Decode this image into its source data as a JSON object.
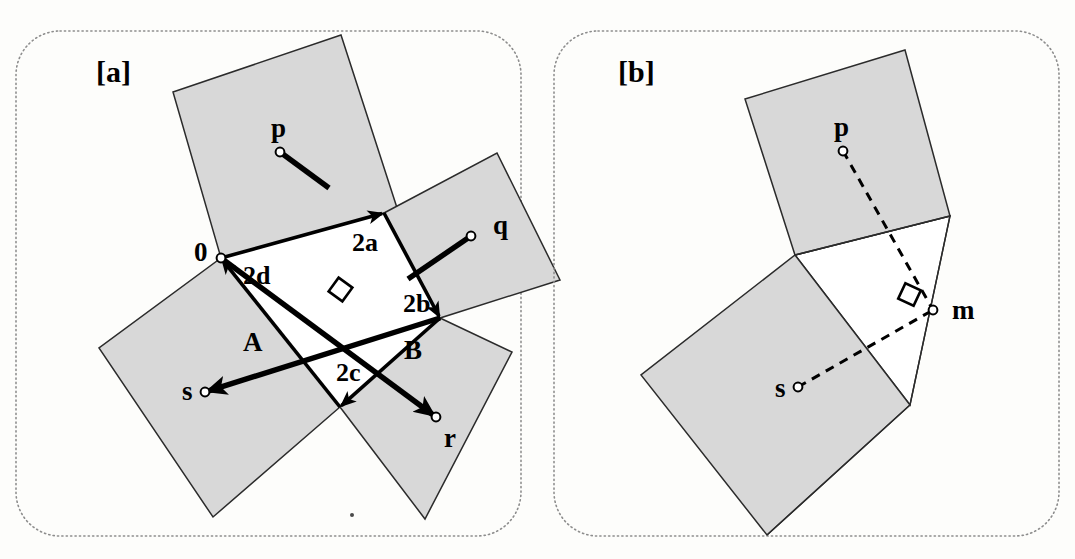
{
  "figure": {
    "background_color": "#fdfdfb",
    "square_fill_color": "#d8d8d8",
    "stroke_color": "#2b2b2b",
    "panel_border_color": "#8d8d8d"
  },
  "panels": [
    {
      "tag": "[a]",
      "tag_x": 96,
      "tag_y": 82,
      "border": {
        "x": 16,
        "y": 31,
        "w": 505,
        "h": 505,
        "r": 44
      },
      "squares": [
        {
          "name": "square-p",
          "points": "173,92 341,35 399,214 221,258",
          "center_label": "p"
        },
        {
          "name": "square-q",
          "points": "384,213 497,153 560,280 440,318",
          "center_label": "q"
        },
        {
          "name": "square-r",
          "points": "440,318 512,352 425,519 340,407",
          "center_label": "r"
        },
        {
          "name": "square-s",
          "points": "221,258 340,407 213,517 99,348",
          "center_label": "s"
        }
      ],
      "inner_quad": {
        "name": "inner-quadrilateral",
        "points": "221,258 384,213 440,318 340,407"
      },
      "vectors": [
        {
          "name": "vector-A",
          "label": "A",
          "label_x": 243,
          "label_y": 351,
          "from_x": 440,
          "from_y": 318,
          "to_x": 205,
          "to_y": 392,
          "endpoint": "s",
          "width": "thick"
        },
        {
          "name": "vector-B",
          "label": "B",
          "label_x": 404,
          "label_y": 359,
          "from_x": 221,
          "from_y": 258,
          "to_x": 436,
          "to_y": 417,
          "endpoint": "r",
          "width": "thick"
        }
      ],
      "measures": [
        {
          "name": "measure-2a",
          "label": "2a",
          "label_x": 352,
          "label_y": 251,
          "tip_x": 384,
          "tip_y": 213,
          "tail_x": 221,
          "tail_y": 258
        },
        {
          "name": "measure-2b",
          "label": "2b",
          "label_x": 403,
          "label_y": 312,
          "tip_x": 440,
          "tip_y": 318,
          "tail_x": 384,
          "tail_y": 213
        },
        {
          "name": "measure-2c",
          "label": "2c",
          "label_x": 336,
          "label_y": 381,
          "tip_x": 340,
          "tip_y": 407,
          "tail_x": 440,
          "tail_y": 318
        },
        {
          "name": "measure-2d",
          "label": "2d",
          "label_x": 243,
          "label_y": 284,
          "tip_x": 221,
          "tip_y": 258,
          "tail_x": 340,
          "tail_y": 407
        }
      ],
      "nodes": [
        {
          "name": "node-p",
          "label": "p",
          "cx": 280,
          "cy": 152,
          "label_x": 271,
          "label_y": 137
        },
        {
          "name": "node-q",
          "label": "q",
          "cx": 471,
          "cy": 236,
          "label_x": 493,
          "label_y": 234
        },
        {
          "name": "node-r",
          "label": "r",
          "cx": 436,
          "cy": 417,
          "label_x": 444,
          "label_y": 447
        },
        {
          "name": "node-s",
          "label": "s",
          "cx": 205,
          "cy": 392,
          "label_x": 182,
          "label_y": 400
        },
        {
          "name": "node-origin",
          "label": "0",
          "cx": 221,
          "cy": 258,
          "label_x": 194,
          "label_y": 261
        }
      ],
      "right_angle": {
        "name": "right-angle-marker",
        "x": 332,
        "y": 281
      }
    },
    {
      "tag": "[b]",
      "tag_x": 618,
      "tag_y": 82,
      "border": {
        "x": 554,
        "y": 31,
        "w": 505,
        "h": 505,
        "r": 44
      },
      "squares": [
        {
          "name": "square-p",
          "points": "745,99 905,50 950,216 795,255",
          "center_label": "p"
        },
        {
          "name": "square-s",
          "points": "795,255 910,405 767,535 641,375",
          "center_label": "s"
        }
      ],
      "white_region": {
        "name": "white-triangle-region",
        "points": "795,255 950,216 910,405"
      },
      "dashed_lines": [
        {
          "name": "dashed-p-to-m",
          "x1": 843,
          "y1": 151,
          "x2": 933,
          "y2": 310
        },
        {
          "name": "dashed-s-to-m",
          "x1": 798,
          "y1": 387,
          "x2": 933,
          "y2": 310
        }
      ],
      "nodes": [
        {
          "name": "node-p",
          "label": "p",
          "cx": 843,
          "cy": 151,
          "label_x": 834,
          "label_y": 136
        },
        {
          "name": "node-s",
          "label": "s",
          "cx": 798,
          "cy": 387,
          "label_x": 775,
          "label_y": 397
        },
        {
          "name": "node-m",
          "label": "m",
          "cx": 933,
          "cy": 310,
          "label_x": 952,
          "label_y": 319
        }
      ],
      "right_angle": {
        "name": "right-angle-marker",
        "x": 901,
        "y": 286
      }
    }
  ]
}
